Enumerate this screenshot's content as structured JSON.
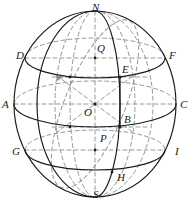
{
  "figure": {
    "width": 194,
    "height": 203,
    "background_color": "#ffffff",
    "solid_stroke_color": "#1a1a1a",
    "dashed_stroke_color": "#8c8c8c",
    "label_color": "#1a1a1a"
  },
  "sphere": {
    "center_x": 95,
    "center_y": 104,
    "radius_x": 81,
    "radius_y": 93
  },
  "labels": [
    {
      "id": "N",
      "text": "N",
      "x": 92,
      "y": 2,
      "desc": "north-pole"
    },
    {
      "id": "D",
      "text": "D",
      "x": 16,
      "y": 50,
      "desc": "upper-left-latitude-end"
    },
    {
      "id": "F",
      "text": "F",
      "x": 169,
      "y": 50,
      "desc": "upper-right-latitude-end"
    },
    {
      "id": "Q",
      "text": "Q",
      "x": 97,
      "y": 43,
      "desc": "upper-axis-point"
    },
    {
      "id": "E",
      "text": "E",
      "x": 122,
      "y": 64,
      "desc": "upper-meridian-intersection"
    },
    {
      "id": "A",
      "text": "A",
      "x": 2,
      "y": 99,
      "desc": "equator-left-end"
    },
    {
      "id": "C",
      "text": "C",
      "x": 180,
      "y": 99,
      "desc": "equator-right-end"
    },
    {
      "id": "O",
      "text": "O",
      "x": 84,
      "y": 107,
      "desc": "sphere-center"
    },
    {
      "id": "B",
      "text": "B",
      "x": 124,
      "y": 114,
      "desc": "lower-meridian-intersection"
    },
    {
      "id": "P",
      "text": "P",
      "x": 100,
      "y": 133,
      "desc": "lower-axis-point"
    },
    {
      "id": "G",
      "text": "G",
      "x": 12,
      "y": 146,
      "desc": "lower-left-latitude-end"
    },
    {
      "id": "I",
      "text": "I",
      "x": 175,
      "y": 146,
      "desc": "lower-right-latitude-end"
    },
    {
      "id": "H",
      "text": "H",
      "x": 117,
      "y": 172,
      "desc": "lower-meridian-point"
    },
    {
      "id": "S",
      "text": "S",
      "x": 93,
      "y": 189,
      "desc": "south-pole"
    }
  ],
  "geometry": {
    "latitude_circles": [
      {
        "name": "upper-latitude-DF",
        "cy": 58,
        "rx": 70,
        "ry": 20
      },
      {
        "name": "equator-AC",
        "cy": 104,
        "rx": 81,
        "ry": 23
      },
      {
        "name": "lower-latitude-GI",
        "cy": 150,
        "rx": 70,
        "ry": 20
      }
    ],
    "polar_axis": {
      "x": 95,
      "y1": 11,
      "y2": 197
    },
    "meridians": [
      {
        "name": "meridian-front-NEBHS",
        "rx": 25,
        "style": "solid"
      },
      {
        "name": "meridian-back-dashed",
        "rx": 40,
        "style": "dashed"
      },
      {
        "name": "meridian-left-dashed",
        "rx": 58,
        "style": "dashed"
      }
    ],
    "oblique_ellipse": {
      "name": "tilted-great-circle",
      "style": "dashed"
    },
    "dots": [
      {
        "name": "center-dot-O",
        "x": 95,
        "y": 104
      },
      {
        "name": "dot-E",
        "x": 120,
        "y": 77
      },
      {
        "name": "dot-B",
        "x": 120,
        "y": 127
      },
      {
        "name": "dot-Q",
        "x": 95,
        "y": 58
      },
      {
        "name": "dot-P",
        "x": 95,
        "y": 150
      }
    ]
  }
}
